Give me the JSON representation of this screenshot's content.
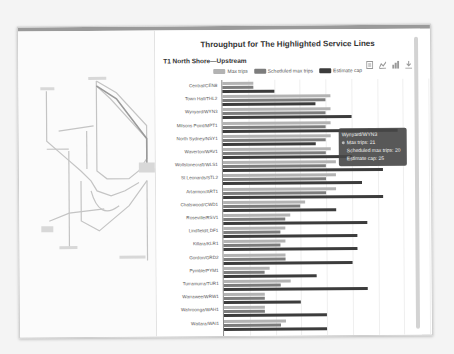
{
  "page": {
    "chart_title": "Throughput for The Highlighted Service Lines",
    "section_title": "T1 North Shore—Upstream",
    "toolbox": [
      {
        "icon": "data-view-icon"
      },
      {
        "icon": "line-chart-icon"
      },
      {
        "icon": "bar-chart-icon"
      },
      {
        "icon": "download-icon"
      }
    ],
    "legend": [
      {
        "label": "Max trips",
        "color": "#b3b3b3"
      },
      {
        "label": "Scheduled max trips",
        "color": "#7d7d7d"
      },
      {
        "label": "Estimate cap",
        "color": "#3c3c3c"
      }
    ],
    "tooltip": {
      "title": "Wynyard/WYN3",
      "line1": "Max trips: 21",
      "line2": "Scheduled max trips: 20",
      "line3": "Estimate cap: 25"
    },
    "map": {
      "description": "Sydney Trains network map (faded)"
    }
  },
  "chart_data": {
    "type": "bar",
    "orientation": "horizontal",
    "title": "Throughput for The Highlighted Service Lines",
    "subtitle": "T1 North Shore—Upstream",
    "xlabel": "",
    "ylabel": "",
    "xlim": [
      0,
      40
    ],
    "grid": true,
    "legend_position": "top",
    "categories": [
      "Central/CEN8",
      "Town Hall/THL2",
      "Wynyard/WYN3",
      "Milsons Point/MPT1",
      "North Sydney/NSY1",
      "Waverton/WAV1",
      "Wollstonecraft/WLS1",
      "St Leonards/STL2",
      "Artarmon/ART1",
      "Chatswood/CWD1",
      "Roseville/RSV1",
      "Lindfield/LDF1",
      "Killara/KLR1",
      "Gordon/GRD2",
      "Pymble/PYM1",
      "Turramurra/TUR1",
      "Warrawee/WRW1",
      "Wahroonga/WAH1",
      "Waitara/WAI1"
    ],
    "series": [
      {
        "name": "Max trips",
        "color": "#b3b3b3",
        "values": [
          6,
          21,
          21,
          21,
          21,
          21,
          22,
          22,
          22,
          16,
          13,
          12,
          12,
          12,
          9,
          13,
          8,
          8,
          12
        ]
      },
      {
        "name": "Scheduled max trips",
        "color": "#7d7d7d",
        "values": [
          6,
          20,
          20,
          20,
          20,
          20,
          20,
          20,
          20,
          15,
          12,
          11,
          11,
          12,
          8,
          11,
          8,
          8,
          11
        ]
      },
      {
        "name": "Estimate cap",
        "color": "#3c3c3c",
        "values": [
          10,
          18,
          25,
          34,
          18,
          25,
          31,
          27,
          31,
          22,
          28,
          26,
          26,
          25,
          18,
          28,
          15,
          20,
          20
        ]
      }
    ],
    "annotations": [
      {
        "type": "tooltip",
        "category": "Wynyard/WYN3",
        "text": [
          "Max trips: 21",
          "Scheduled max trips: 20",
          "Estimate cap: 25"
        ]
      }
    ]
  }
}
